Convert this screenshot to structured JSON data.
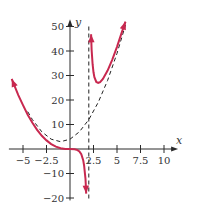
{
  "chart_data": {
    "type": "line",
    "title": "",
    "function": "f(x) = x^3 / (x - 2)",
    "xlabel": "x",
    "ylabel": "y",
    "xlim": [
      -6.5,
      11.5
    ],
    "ylim": [
      -21,
      53
    ],
    "grid": false,
    "legend": null,
    "x_ticks": [
      -5,
      -2.5,
      2.5,
      5,
      7.5,
      10
    ],
    "x_tick_labels": [
      "−5",
      "−2.5",
      "2.5",
      "5",
      "7.5",
      "10"
    ],
    "y_ticks": [
      50,
      40,
      30,
      20,
      10,
      -10,
      -20
    ],
    "y_tick_labels": [
      "50",
      "40",
      "30",
      "20",
      "10",
      "−10",
      "−20"
    ],
    "series": [
      {
        "name": "f(x) left branch",
        "style": "solid",
        "color": "#c8284f",
        "x": [
          -6.2,
          -5.5,
          -5,
          -4.5,
          -4,
          -3.5,
          -3,
          -2.5,
          -2,
          -1.5,
          -1,
          -0.5,
          0,
          0.5,
          0.8,
          1,
          1.2,
          1.4,
          1.5,
          1.6,
          1.65,
          1.7,
          1.72
        ],
        "y": [
          28.6,
          22.0,
          17.9,
          14.0,
          10.7,
          7.8,
          5.4,
          3.5,
          2.0,
          1.0,
          0.33,
          0.05,
          0,
          -0.08,
          -0.43,
          -1.0,
          -2.16,
          -4.57,
          -6.75,
          -10.24,
          -12.25,
          -16.4,
          -18.2
        ]
      },
      {
        "name": "f(x) right branch",
        "style": "solid",
        "color": "#c8284f",
        "x": [
          2.24,
          2.3,
          2.4,
          2.5,
          2.6,
          2.8,
          3,
          3.2,
          3.5,
          4,
          4.5,
          5,
          5.5,
          5.9
        ],
        "y": [
          46.8,
          40.6,
          34.6,
          31.3,
          29.3,
          27.4,
          27.0,
          27.3,
          28.6,
          32.0,
          36.5,
          41.7,
          47.5,
          52.0
        ]
      },
      {
        "name": "slant asymptote y = x^2 + 2x + 4",
        "style": "dashed",
        "color": "#222222",
        "x": [
          -4.5,
          -4,
          -3,
          -2,
          -1,
          0,
          1,
          2,
          3,
          4,
          5,
          5.9
        ],
        "y": [
          15.25,
          12,
          7,
          4,
          3,
          4,
          7,
          12,
          19,
          28,
          39,
          50.6
        ]
      },
      {
        "name": "vertical asymptote x = 2",
        "style": "dashed",
        "color": "#222222",
        "x": [
          2,
          2
        ],
        "y": [
          50,
          -21
        ]
      }
    ],
    "annotations": [
      {
        "type": "arrow",
        "at": "left branch start",
        "x": -6.2,
        "y": 28.6
      },
      {
        "type": "arrow",
        "at": "left branch end (down)",
        "x": 1.72,
        "y": -18.2
      },
      {
        "type": "arrow",
        "at": "right branch start (up)",
        "x": 2.24,
        "y": 46.8
      },
      {
        "type": "arrow",
        "at": "right branch end (up)",
        "x": 5.9,
        "y": 52.0
      }
    ]
  },
  "layout": {
    "origin_px": [
      70,
      149
    ],
    "px_per_x": 9.4,
    "px_per_y": 2.45
  }
}
